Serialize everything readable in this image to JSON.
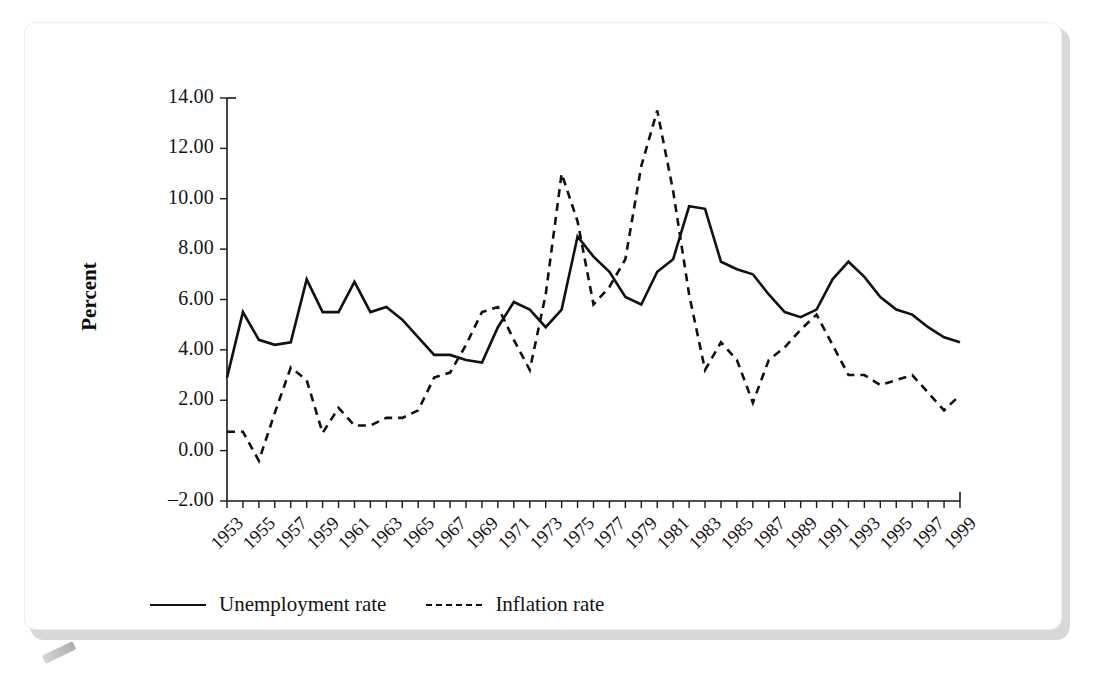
{
  "figure": {
    "kind": "line-chart-figure",
    "y_axis_title": "Percent",
    "legend": [
      {
        "label": "Unemployment rate",
        "style": "solid"
      },
      {
        "label": "Inflation rate",
        "style": "dashed"
      }
    ]
  },
  "colors": {
    "line": "#111111",
    "axis": "#1a1a1a",
    "card": "#ffffff",
    "frame": "#d8d8d8"
  },
  "chart_data": {
    "type": "line",
    "title": "",
    "xlabel": "",
    "ylabel": "Percent",
    "ylim": [
      -2.0,
      14.0
    ],
    "ytick_values": [
      -2.0,
      0.0,
      2.0,
      4.0,
      6.0,
      8.0,
      10.0,
      12.0,
      14.0
    ],
    "ytick_labels": [
      "-2.00",
      "0.00",
      "2.00",
      "4.00",
      "6.00",
      "8.00",
      "10.00",
      "12.00",
      "14.00"
    ],
    "xlim": [
      1953,
      1999
    ],
    "x": [
      1953,
      1954,
      1955,
      1956,
      1957,
      1958,
      1959,
      1960,
      1961,
      1962,
      1963,
      1964,
      1965,
      1966,
      1967,
      1968,
      1969,
      1970,
      1971,
      1972,
      1973,
      1974,
      1975,
      1976,
      1977,
      1978,
      1979,
      1980,
      1981,
      1982,
      1983,
      1984,
      1985,
      1986,
      1987,
      1988,
      1989,
      1990,
      1991,
      1992,
      1993,
      1994,
      1995,
      1996,
      1997,
      1998,
      1999
    ],
    "xtick_labels": [
      "1953",
      "1955",
      "1957",
      "1959",
      "1961",
      "1963",
      "1965",
      "1967",
      "1969",
      "1971",
      "1973",
      "1975",
      "1977",
      "1979",
      "1981",
      "1983",
      "1985",
      "1987",
      "1989",
      "1991",
      "1993",
      "1995",
      "1997",
      "1999"
    ],
    "xtick_step": 2,
    "grid": false,
    "legend_position": "below-axes-left",
    "series": [
      {
        "name": "Unemployment rate",
        "style": "solid",
        "values": [
          2.9,
          5.5,
          4.4,
          4.2,
          4.3,
          6.8,
          5.5,
          5.5,
          6.7,
          5.5,
          5.7,
          5.2,
          4.5,
          3.8,
          3.8,
          3.6,
          3.5,
          4.9,
          5.9,
          5.6,
          4.9,
          5.6,
          8.5,
          7.7,
          7.1,
          6.1,
          5.8,
          7.1,
          7.6,
          9.7,
          9.6,
          7.5,
          7.2,
          7.0,
          6.2,
          5.5,
          5.3,
          5.6,
          6.8,
          7.5,
          6.9,
          6.1,
          5.6,
          5.4,
          4.9,
          4.5,
          4.3
        ]
      },
      {
        "name": "Inflation rate",
        "style": "dashed",
        "values": [
          0.75,
          0.75,
          -0.4,
          1.5,
          3.3,
          2.8,
          0.7,
          1.7,
          1.0,
          1.0,
          1.3,
          1.3,
          1.6,
          2.9,
          3.1,
          4.2,
          5.5,
          5.7,
          4.4,
          3.2,
          6.2,
          11.0,
          9.1,
          5.8,
          6.5,
          7.6,
          11.3,
          13.5,
          10.3,
          6.2,
          3.2,
          4.3,
          3.6,
          1.9,
          3.6,
          4.1,
          4.8,
          5.4,
          4.2,
          3.0,
          3.0,
          2.6,
          2.8,
          3.0,
          2.3,
          1.6,
          2.2
        ]
      }
    ]
  }
}
